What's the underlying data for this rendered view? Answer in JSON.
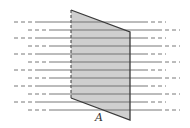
{
  "diagram": {
    "surface_label": "A",
    "colors": {
      "surface_fill": "#cfcfcf",
      "surface_edge": "#3a3a3a",
      "field_line": "#6a6a6a"
    },
    "surface": {
      "top_left": [
        71,
        10
      ],
      "top_right": [
        130,
        32
      ],
      "bottom_right": [
        130,
        120
      ],
      "bottom_left": [
        71,
        98
      ]
    },
    "field_lines": [
      {
        "y": 22,
        "start": 14,
        "end": 166
      },
      {
        "y": 30,
        "start": 28,
        "end": 180
      },
      {
        "y": 38,
        "start": 14,
        "end": 166
      },
      {
        "y": 46,
        "start": 28,
        "end": 180
      },
      {
        "y": 54,
        "start": 14,
        "end": 166
      },
      {
        "y": 62,
        "start": 28,
        "end": 180
      },
      {
        "y": 70,
        "start": 14,
        "end": 166
      },
      {
        "y": 78,
        "start": 28,
        "end": 180
      },
      {
        "y": 86,
        "start": 14,
        "end": 166
      },
      {
        "y": 94,
        "start": 28,
        "end": 180
      },
      {
        "y": 102,
        "start": 14,
        "end": 166
      },
      {
        "y": 110,
        "start": 28,
        "end": 180
      }
    ]
  }
}
